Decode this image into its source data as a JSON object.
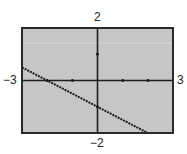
{
  "window": {
    "xmin": -3,
    "xmax": 3,
    "ymin": -2,
    "ymax": 2,
    "xscl": 1,
    "yscl": 1
  },
  "labels": {
    "ymax": "2",
    "ymin": "−2",
    "xmin": "−3",
    "xmax": "3"
  },
  "colors": {
    "screen": "#c6c6c6",
    "frame": "#2a2a2a",
    "axis": "#1e1e1e",
    "line": "#1a1a1a"
  },
  "chart_data": {
    "type": "line",
    "title": "",
    "xlabel": "",
    "ylabel": "",
    "xlim": [
      -3,
      3
    ],
    "ylim": [
      -2,
      2
    ],
    "grid": false,
    "tick_labels": {
      "x": [
        "-3",
        "3"
      ],
      "y": [
        "-2",
        "2"
      ]
    },
    "series": [
      {
        "name": "y = -0.5x - 1",
        "x": [
          -3,
          -2,
          -1,
          0,
          1,
          2
        ],
        "values": [
          0.5,
          0,
          -0.5,
          -1,
          -1.5,
          -2
        ],
        "style": "dotted"
      }
    ],
    "annotations": []
  }
}
